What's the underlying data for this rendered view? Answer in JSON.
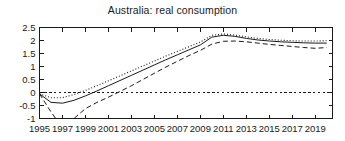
{
  "chart_data": {
    "type": "line",
    "title": "Australia: real consumption",
    "xlabel": "",
    "ylabel": "",
    "xlim": [
      1995,
      2020.5
    ],
    "ylim": [
      -1,
      2.5
    ],
    "grid": false,
    "legend": null,
    "legend_position": "none",
    "yticks": [
      2.5,
      2,
      1.5,
      1,
      0.5,
      0,
      -0.5,
      -1
    ],
    "ytick_labels": [
      "2.5",
      "2",
      "1.5",
      "1",
      "0.5",
      "0",
      "-0.5",
      "-1"
    ],
    "xticks": [
      1995,
      1997,
      1999,
      2001,
      2003,
      2005,
      2007,
      2009,
      2011,
      2013,
      2015,
      2017,
      2019
    ],
    "xtick_labels": [
      "1995",
      "1997",
      "1999",
      "2001",
      "2003",
      "2005",
      "2007",
      "2009",
      "2011",
      "2013",
      "2015",
      "2017",
      "2019"
    ],
    "x": [
      1995,
      1996,
      1997,
      1998,
      1999,
      2000,
      2001,
      2002,
      2003,
      2004,
      2005,
      2006,
      2007,
      2008,
      2009,
      2010,
      2011,
      2012,
      2013,
      2014,
      2015,
      2016,
      2017,
      2018,
      2019,
      2020
    ],
    "series": [
      {
        "name": "solid",
        "style": "solid",
        "color": "#1a1a1a",
        "values": [
          -0.05,
          -0.38,
          -0.41,
          -0.3,
          -0.13,
          0.06,
          0.26,
          0.46,
          0.66,
          0.86,
          1.06,
          1.26,
          1.45,
          1.64,
          1.83,
          2.13,
          2.2,
          2.16,
          2.08,
          2.02,
          1.98,
          1.95,
          1.93,
          1.91,
          1.9,
          1.9
        ]
      },
      {
        "name": "dotted",
        "style": "dotted",
        "color": "#1a1a1a",
        "values": [
          -0.05,
          -0.2,
          -0.2,
          -0.08,
          0.08,
          0.26,
          0.45,
          0.64,
          0.83,
          1.02,
          1.21,
          1.4,
          1.58,
          1.76,
          1.94,
          2.2,
          2.25,
          2.21,
          2.14,
          2.08,
          2.04,
          2.01,
          1.99,
          1.98,
          1.98,
          1.99
        ]
      },
      {
        "name": "dashed",
        "style": "dashed",
        "color": "#1a1a1a",
        "values": [
          -0.05,
          -0.75,
          -1.35,
          -1.0,
          -0.62,
          -0.38,
          -0.18,
          0.04,
          0.26,
          0.5,
          0.74,
          0.98,
          1.2,
          1.42,
          1.62,
          1.86,
          1.97,
          1.98,
          1.95,
          1.9,
          1.85,
          1.81,
          1.77,
          1.73,
          1.7,
          1.73
        ]
      }
    ],
    "reference_line": {
      "name": "zero-line",
      "style": "dashed",
      "value": 0
    }
  }
}
